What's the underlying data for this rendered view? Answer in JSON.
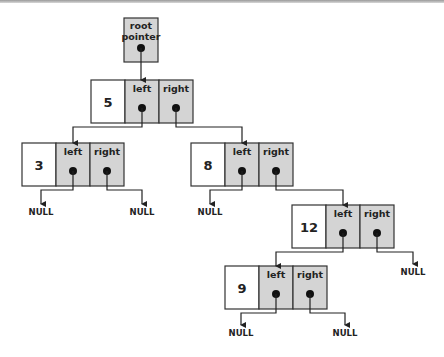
{
  "diagram": {
    "colors": {
      "pointer_cell_fill": "#d4d4d4",
      "value_cell_fill": "#ffffff",
      "stroke": "#333333",
      "dot": "#111111"
    },
    "root_pointer": {
      "label_line1": "root",
      "label_line2": "pointer",
      "points_to": "5"
    },
    "field_labels": {
      "left": "left",
      "right": "right"
    },
    "null_label": "NULL",
    "nodes": [
      {
        "id": "n5",
        "value": "5",
        "left": "n3",
        "right": "n8"
      },
      {
        "id": "n3",
        "value": "3",
        "left": null,
        "right": null
      },
      {
        "id": "n8",
        "value": "8",
        "left": null,
        "right": "n12"
      },
      {
        "id": "n12",
        "value": "12",
        "left": "n9",
        "right": null
      },
      {
        "id": "n9",
        "value": "9",
        "left": null,
        "right": null
      }
    ]
  }
}
